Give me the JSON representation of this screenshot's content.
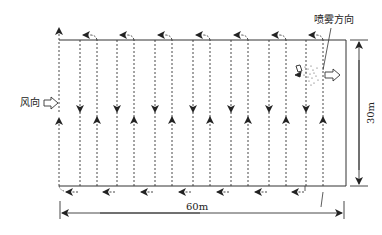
{
  "diagram": {
    "type": "flight-path-spray-layout",
    "labels": {
      "wind_direction": "风向",
      "spray_direction": "喷雾方向",
      "width_dimension": "60m",
      "height_dimension": "30m"
    },
    "field": {
      "width_m": 60,
      "height_m": 30
    },
    "caption": "",
    "colors": {
      "stroke": "#222222",
      "background": "#ffffff"
    },
    "flight_lines": {
      "pairs_count": 7,
      "description": "Dashed vertical flight paths; down arrows on left line of each pair, up arrows on right line; U-turn arrows at top and leftward arrows along bottom"
    },
    "icons": [
      "drone-icon",
      "spray-mist-icon",
      "wind-arrow-icon",
      "spray-direction-arrow-icon"
    ]
  }
}
